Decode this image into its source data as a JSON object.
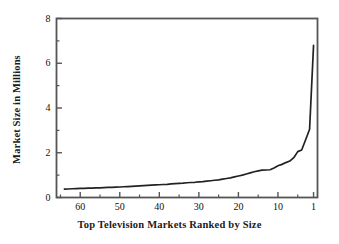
{
  "chart_data": {
    "type": "line",
    "title": "",
    "xlabel": "Top Television Markets Ranked by Size",
    "ylabel": "Market Size in Millions",
    "xlim": [
      66,
      0
    ],
    "ylim": [
      0,
      8
    ],
    "x_reversed": true,
    "grid": false,
    "legend": null,
    "x_tick_labels": [
      "60",
      "50",
      "40",
      "30",
      "20",
      "10",
      "1"
    ],
    "x_tick_values": [
      60,
      50,
      40,
      30,
      20,
      10,
      1
    ],
    "y_tick_labels": [
      "0",
      "2",
      "4",
      "6",
      "8"
    ],
    "y_tick_values": [
      0,
      2,
      4,
      6,
      8
    ],
    "y_minor_tick_values": [
      1,
      3,
      5,
      7
    ],
    "x_minor_tick_values": [
      65,
      55,
      45,
      35,
      25,
      15,
      5
    ],
    "series": [
      {
        "name": "Market Size",
        "x": [
          64,
          63,
          62,
          61,
          60,
          59,
          58,
          57,
          56,
          55,
          54,
          53,
          52,
          51,
          50,
          49,
          48,
          47,
          46,
          45,
          44,
          43,
          42,
          41,
          40,
          39,
          38,
          37,
          36,
          35,
          34,
          33,
          32,
          31,
          30,
          29,
          28,
          27,
          26,
          25,
          24,
          23,
          22,
          21,
          20,
          19,
          18,
          17,
          16,
          15,
          14,
          13,
          12,
          11,
          10,
          9,
          8,
          7,
          6,
          5,
          4,
          3,
          2,
          1
        ],
        "y": [
          0.37,
          0.38,
          0.39,
          0.4,
          0.41,
          0.41,
          0.42,
          0.42,
          0.43,
          0.43,
          0.44,
          0.45,
          0.45,
          0.46,
          0.47,
          0.48,
          0.49,
          0.5,
          0.51,
          0.52,
          0.53,
          0.54,
          0.55,
          0.56,
          0.57,
          0.58,
          0.59,
          0.61,
          0.62,
          0.63,
          0.64,
          0.66,
          0.67,
          0.68,
          0.7,
          0.71,
          0.73,
          0.75,
          0.77,
          0.79,
          0.82,
          0.85,
          0.88,
          0.92,
          0.96,
          1.0,
          1.05,
          1.1,
          1.15,
          1.19,
          1.22,
          1.23,
          1.24,
          1.32,
          1.42,
          1.48,
          1.56,
          1.63,
          1.78,
          2.05,
          2.12,
          2.58,
          3.05,
          6.8
        ]
      }
    ],
    "line_color": "#222222",
    "frame_color": "#555555"
  },
  "axes": {
    "y_label_text": "Market Size in Millions",
    "x_label_text": "Top Television Markets Ranked by Size"
  },
  "tick_text": {
    "y": [
      "8",
      "6",
      "4",
      "2",
      "0"
    ],
    "x": [
      "60",
      "50",
      "40",
      "30",
      "20",
      "10",
      "1"
    ]
  }
}
